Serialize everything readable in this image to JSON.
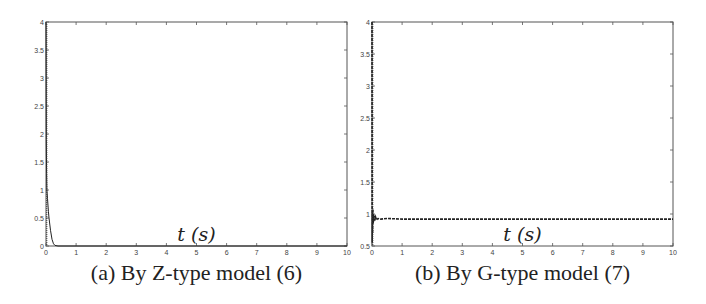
{
  "chart_data": [
    {
      "type": "line",
      "panel": "a",
      "title": "",
      "caption": "(a) By Z-type model (6)",
      "xlabel": "t (s)",
      "ylabel": "",
      "xlim": [
        0,
        10
      ],
      "ylim": [
        0,
        4
      ],
      "xticks": [
        0,
        1,
        2,
        3,
        4,
        5,
        6,
        7,
        8,
        9,
        10
      ],
      "yticks": [
        0,
        0.5,
        1,
        1.5,
        2,
        2.5,
        3,
        3.5,
        4
      ],
      "ytick_labels": [
        "0",
        "0.5",
        "1",
        "1.5",
        "2",
        "2.5",
        "3",
        "3.5",
        "4"
      ],
      "grid": false,
      "legend": null,
      "series": [
        {
          "name": "residual",
          "x": [
            0,
            0.005,
            0.01,
            0.02,
            0.03,
            0.05,
            0.08,
            0.1,
            0.15,
            0.2,
            0.25,
            0.3,
            0.4,
            1,
            2,
            3,
            4,
            5,
            6,
            7,
            8,
            9,
            10
          ],
          "y": [
            4.0,
            2.6,
            1.9,
            1.3,
            1.0,
            0.85,
            0.62,
            0.5,
            0.28,
            0.12,
            0.04,
            0.01,
            0,
            0,
            0,
            0,
            0,
            0,
            0,
            0,
            0,
            0,
            0
          ]
        }
      ]
    },
    {
      "type": "line",
      "panel": "b",
      "title": "",
      "caption": "(b) By G-type model (7)",
      "xlabel": "t (s)",
      "ylabel": "",
      "xlim": [
        0,
        10
      ],
      "ylim": [
        0.5,
        4
      ],
      "xticks": [
        0,
        1,
        2,
        3,
        4,
        5,
        6,
        7,
        8,
        9,
        10
      ],
      "yticks": [
        0.5,
        1,
        1.5,
        2,
        2.5,
        3,
        3.5,
        4
      ],
      "ytick_labels": [
        "0.5",
        "1",
        "1.5",
        "2",
        "2.5",
        "3",
        "3.5",
        "4"
      ],
      "grid": false,
      "legend": null,
      "series": [
        {
          "name": "residual",
          "x": [
            0,
            0.005,
            0.01,
            0.02,
            0.03,
            0.04,
            0.05,
            0.06,
            0.08,
            0.1,
            0.12,
            0.15,
            0.2,
            0.3,
            0.5,
            1,
            2,
            3,
            4,
            5,
            6,
            7,
            8,
            9,
            10
          ],
          "y": [
            4.0,
            0.55,
            1.05,
            0.7,
            1.08,
            0.85,
            1.0,
            0.88,
            0.97,
            0.9,
            0.95,
            0.91,
            0.93,
            0.92,
            0.93,
            0.92,
            0.92,
            0.92,
            0.92,
            0.92,
            0.92,
            0.92,
            0.92,
            0.92,
            0.92
          ]
        }
      ]
    }
  ],
  "captions": {
    "a": "(a) By Z-type model (6)",
    "b": "(b) By G-type model (7)"
  },
  "axis_labels": {
    "a_x": "t (s)",
    "b_x": "t (s)"
  }
}
